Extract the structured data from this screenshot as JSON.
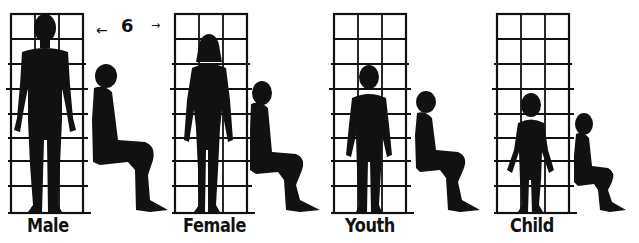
{
  "figure": {
    "dimension_label": "6",
    "groups": [
      {
        "id": "male",
        "label": "Male"
      },
      {
        "id": "female",
        "label": "Female"
      },
      {
        "id": "youth",
        "label": "Youth"
      },
      {
        "id": "child",
        "label": "Child"
      }
    ],
    "colors": {
      "ink": "#111111",
      "background": "#ffffff"
    }
  }
}
